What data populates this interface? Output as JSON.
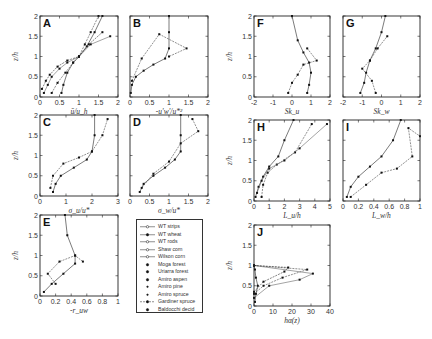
{
  "figure": {
    "ylabel": "z/h",
    "legend": {
      "items": [
        {
          "label": "WT strips",
          "marker": "open-circle",
          "line": "solid"
        },
        {
          "label": "WT wheat",
          "marker": "filled-circle",
          "line": "solid"
        },
        {
          "label": "WT rods",
          "marker": "plus",
          "line": "solid"
        },
        {
          "label": "Shaw corn",
          "marker": "open-square",
          "line": "solid"
        },
        {
          "label": "Wilson corn",
          "marker": "open-diamond",
          "line": "solid"
        },
        {
          "label": "Moga forest",
          "marker": "filled-square",
          "line": "none"
        },
        {
          "label": "Uriarra forest",
          "marker": "filled-triangle",
          "line": "none"
        },
        {
          "label": "Amiro aspen",
          "marker": "filled-circle",
          "line": "none"
        },
        {
          "label": "Amiro pine",
          "marker": "small-dot",
          "line": "none"
        },
        {
          "label": "Amiro spruce",
          "marker": "small-dot",
          "line": "none"
        },
        {
          "label": "Gardiner spruce",
          "marker": "filled-circle",
          "line": "dashed"
        },
        {
          "label": "Baldocchi decid",
          "marker": "filled-square",
          "line": "none"
        }
      ]
    }
  },
  "chart_data": [
    {
      "panel": "A",
      "type": "line",
      "xlabel": "ū/u_h",
      "ylabel": "z/h",
      "xlim": [
        0,
        2
      ],
      "ylim": [
        0,
        2
      ],
      "xticks": [
        "0",
        "0.5",
        "1",
        "1.5",
        "2"
      ],
      "yticks": [
        "0",
        "0.5",
        "1",
        "1.5",
        "2"
      ],
      "series": [
        {
          "name": "WT strips",
          "x": [
            0.55,
            0.6,
            0.7,
            0.85,
            1.0,
            1.2,
            1.4,
            1.6
          ],
          "y": [
            0.1,
            0.3,
            0.6,
            0.85,
            1.0,
            1.25,
            1.6,
            2.0
          ]
        },
        {
          "name": "WT wheat",
          "x": [
            0.3,
            0.45,
            0.65,
            0.85,
            1.0,
            1.15,
            1.3,
            1.5
          ],
          "y": [
            0.1,
            0.35,
            0.6,
            0.85,
            1.0,
            1.3,
            1.6,
            2.0
          ]
        },
        {
          "name": "Moga forest",
          "x": [
            0.1,
            0.2,
            0.3,
            0.5,
            0.7,
            1.0,
            1.3,
            1.8
          ],
          "y": [
            0.1,
            0.3,
            0.5,
            0.7,
            0.85,
            1.0,
            1.3,
            1.5
          ]
        },
        {
          "name": "Amiro aspen",
          "x": [
            0.05,
            0.15,
            0.25,
            0.45,
            0.7,
            1.0,
            1.25,
            1.6
          ],
          "y": [
            0.2,
            0.4,
            0.55,
            0.75,
            0.9,
            1.0,
            1.3,
            1.6
          ]
        }
      ]
    },
    {
      "panel": "B",
      "type": "line",
      "xlabel": "-u'w'/u*²",
      "ylabel": "z/h",
      "xlim": [
        0,
        2
      ],
      "ylim": [
        0,
        2
      ],
      "xticks": [
        "0",
        "0.5",
        "1",
        "1.5",
        "2"
      ],
      "yticks": [
        "0",
        "0.5",
        "1",
        "1.5",
        "2"
      ],
      "series": [
        {
          "name": "typical",
          "x": [
            0.02,
            0.05,
            0.15,
            0.35,
            0.6,
            0.9,
            1.0,
            1.0,
            1.0
          ],
          "y": [
            0.1,
            0.3,
            0.5,
            0.65,
            0.8,
            0.95,
            1.2,
            1.6,
            2.0
          ]
        },
        {
          "name": "Gardiner spruce",
          "x": [
            0.05,
            0.3,
            0.75,
            1.45,
            1.0
          ],
          "y": [
            0.4,
            0.95,
            1.55,
            1.2,
            1.0
          ]
        }
      ]
    },
    {
      "panel": "C",
      "type": "line",
      "xlabel": "σ_u/u*",
      "ylabel": "z/h",
      "xlim": [
        0,
        3
      ],
      "ylim": [
        0,
        3
      ],
      "xticks": [
        "0",
        "1",
        "2",
        "3"
      ],
      "yticks": [
        "0",
        "0.5",
        "1",
        "1.5",
        "2"
      ],
      "series": [
        {
          "name": "typical",
          "x": [
            0.5,
            0.6,
            0.8,
            1.3,
            1.8,
            2.0,
            2.1,
            2.1
          ],
          "y": [
            0.1,
            0.3,
            0.5,
            0.7,
            0.9,
            1.1,
            1.5,
            2.0
          ]
        },
        {
          "name": "Moga forest",
          "x": [
            0.4,
            0.5,
            0.9,
            1.5,
            2.0,
            2.4,
            2.6
          ],
          "y": [
            0.2,
            0.5,
            0.8,
            0.95,
            1.1,
            1.5,
            1.9
          ]
        }
      ]
    },
    {
      "panel": "D",
      "type": "line",
      "xlabel": "σ_w/u*",
      "ylabel": "z/h",
      "xlim": [
        0,
        2
      ],
      "ylim": [
        0,
        2
      ],
      "xticks": [
        "0",
        "0.5",
        "1",
        "1.5",
        "2"
      ],
      "yticks": [
        "0",
        "0.5",
        "1",
        "1.5",
        "2"
      ],
      "series": [
        {
          "name": "typical",
          "x": [
            0.25,
            0.35,
            0.6,
            0.9,
            1.15,
            1.3,
            1.3,
            1.3
          ],
          "y": [
            0.1,
            0.3,
            0.5,
            0.7,
            0.9,
            1.1,
            1.5,
            2.0
          ]
        },
        {
          "name": "Gardiner spruce",
          "x": [
            0.3,
            0.6,
            1.0,
            1.3,
            1.75,
            1.6
          ],
          "y": [
            0.2,
            0.55,
            0.85,
            1.3,
            1.6,
            1.9
          ]
        }
      ]
    },
    {
      "panel": "E",
      "type": "line",
      "xlabel": "-r_uw",
      "ylabel": "z/h",
      "xlim": [
        0,
        1
      ],
      "ylim": [
        0,
        2
      ],
      "xticks": [
        "0",
        "0.2",
        "0.4",
        "0.6",
        "0.8",
        "1"
      ],
      "yticks": [
        "0",
        "0.5",
        "1",
        "1.5",
        "2"
      ],
      "series": [
        {
          "name": "typical",
          "x": [
            0.05,
            0.15,
            0.3,
            0.45,
            0.45,
            0.35,
            0.32
          ],
          "y": [
            0.1,
            0.3,
            0.55,
            0.8,
            1.0,
            1.5,
            2.0
          ]
        },
        {
          "name": "Gardiner spruce",
          "x": [
            0.2,
            0.1,
            0.25,
            0.45,
            0.55
          ],
          "y": [
            0.3,
            0.55,
            0.85,
            1.0,
            0.85
          ]
        }
      ]
    },
    {
      "panel": "F",
      "type": "line",
      "xlabel": "Sk_u",
      "ylabel": "z/h",
      "xlim": [
        -2,
        2
      ],
      "ylim": [
        0,
        2
      ],
      "xticks": [
        "-2",
        "-1",
        "0",
        "1",
        "2"
      ],
      "yticks": [
        "0",
        "0.5",
        "1",
        "1.5",
        "2"
      ],
      "series": [
        {
          "name": "typical",
          "x": [
            0.8,
            0.9,
            1.0,
            0.9,
            0.6,
            0.3,
            0.0
          ],
          "y": [
            0.1,
            0.3,
            0.6,
            0.85,
            1.1,
            1.4,
            2.0
          ]
        },
        {
          "name": "forest",
          "x": [
            -0.2,
            0.0,
            0.3,
            0.6,
            1.3,
            0.8
          ],
          "y": [
            0.1,
            0.35,
            0.55,
            0.8,
            0.9,
            1.2
          ]
        }
      ]
    },
    {
      "panel": "G",
      "type": "line",
      "xlabel": "Sk_w",
      "ylabel": "z/h",
      "xlim": [
        -2,
        2
      ],
      "ylim": [
        0,
        2
      ],
      "xticks": [
        "-2",
        "-1",
        "0",
        "1",
        "2"
      ],
      "yticks": [
        "0",
        "0.5",
        "1",
        "1.5",
        "2"
      ],
      "series": [
        {
          "name": "typical",
          "x": [
            -1.1,
            -0.9,
            -0.8,
            -0.6,
            -0.3,
            0.0,
            0.2
          ],
          "y": [
            0.1,
            0.35,
            0.6,
            0.9,
            1.2,
            1.6,
            2.0
          ]
        },
        {
          "name": "forest",
          "x": [
            -0.3,
            -0.5,
            -1.0,
            -0.6,
            -0.2,
            0.3
          ],
          "y": [
            0.1,
            0.4,
            0.7,
            0.9,
            1.2,
            1.5
          ]
        }
      ]
    },
    {
      "panel": "H",
      "type": "line",
      "xlabel": "L_u/h",
      "ylabel": "z/h",
      "xlim": [
        0,
        5
      ],
      "ylim": [
        0,
        2
      ],
      "xticks": [
        "0",
        "1",
        "2",
        "3",
        "4",
        "5"
      ],
      "yticks": [
        "0",
        "0.5",
        "1",
        "1.5",
        "2"
      ],
      "series": [
        {
          "name": "typical",
          "x": [
            0.1,
            0.3,
            0.6,
            1.0,
            1.6,
            2.0,
            2.6
          ],
          "y": [
            0.1,
            0.35,
            0.6,
            0.85,
            1.1,
            1.5,
            2.0
          ]
        },
        {
          "name": "WT",
          "x": [
            0.5,
            0.6,
            0.9,
            1.5,
            2.7,
            3.8
          ],
          "y": [
            0.1,
            0.4,
            0.7,
            0.9,
            1.2,
            1.9
          ]
        },
        {
          "name": "other",
          "x": [
            0.2,
            0.5,
            1.0,
            2.0,
            3.0,
            4.8
          ],
          "y": [
            0.2,
            0.5,
            0.8,
            1.0,
            1.3,
            1.9
          ]
        }
      ]
    },
    {
      "panel": "I",
      "type": "line",
      "xlabel": "L_w/h",
      "ylabel": "z/h",
      "xlim": [
        0,
        1
      ],
      "ylim": [
        0,
        2
      ],
      "xticks": [
        "0",
        "0.2",
        "0.4",
        "0.6",
        "0.8",
        "1"
      ],
      "yticks": [
        "0",
        "0.5",
        "1",
        "1.5",
        "2"
      ],
      "series": [
        {
          "name": "typical",
          "x": [
            0.05,
            0.1,
            0.2,
            0.35,
            0.5,
            0.65,
            0.75
          ],
          "y": [
            0.1,
            0.35,
            0.6,
            0.85,
            1.1,
            1.5,
            2.0
          ]
        },
        {
          "name": "WT",
          "x": [
            0.1,
            0.3,
            0.5,
            0.7,
            0.9,
            0.85,
            1.0
          ],
          "y": [
            0.1,
            0.4,
            0.7,
            0.8,
            1.1,
            1.8,
            1.6
          ]
        }
      ]
    },
    {
      "panel": "J",
      "type": "line",
      "xlabel": "hα(z)",
      "ylabel": "z/h",
      "xlim": [
        0,
        40
      ],
      "ylim": [
        0,
        2
      ],
      "xticks": [
        "0",
        "10",
        "20",
        "30",
        "40"
      ],
      "yticks": [
        "0",
        "0.5",
        "1",
        "1.5",
        "2"
      ],
      "series": [
        {
          "name": "typical",
          "x": [
            0.5,
            1,
            2,
            1,
            0.5,
            0
          ],
          "y": [
            0.1,
            0.3,
            0.5,
            0.7,
            0.9,
            1.0
          ]
        },
        {
          "name": "Amiro",
          "x": [
            0,
            5,
            15,
            28,
            0
          ],
          "y": [
            0.3,
            0.5,
            0.7,
            0.9,
            1.0
          ]
        },
        {
          "name": "Baldocchi",
          "x": [
            0,
            8,
            24,
            31,
            0
          ],
          "y": [
            0.2,
            0.5,
            0.65,
            0.8,
            1.0
          ]
        },
        {
          "name": "Moga",
          "x": [
            0,
            5,
            16,
            18,
            0
          ],
          "y": [
            0.35,
            0.6,
            0.85,
            0.95,
            1.0
          ]
        }
      ]
    }
  ]
}
